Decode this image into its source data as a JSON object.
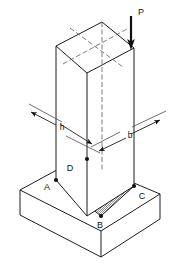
{
  "figure": {
    "type": "engineering-isometric-diagram",
    "background_color": "#ffffff",
    "line_color": "#1c1c1c",
    "hatch_color": "#9a9a9a"
  },
  "labels": {
    "load": "P",
    "depth": "h",
    "width": "b",
    "corner_a": "A",
    "corner_b": "B",
    "corner_c": "C",
    "corner_d": "D"
  },
  "annotations": [
    {
      "id": "load-label",
      "text": "P",
      "x": 141,
      "y": 13,
      "role": "applied-load"
    },
    {
      "id": "dim-h-label",
      "text": "h",
      "x": 62,
      "y": 128,
      "role": "dimension"
    },
    {
      "id": "dim-b-label",
      "text": "b",
      "x": 130,
      "y": 135,
      "role": "dimension"
    },
    {
      "id": "corner-d-label",
      "text": "D",
      "x": 69,
      "y": 170,
      "role": "vertex"
    },
    {
      "id": "corner-a-label",
      "text": "A",
      "x": 46,
      "y": 188,
      "role": "vertex"
    },
    {
      "id": "corner-c-label",
      "text": "C",
      "x": 135,
      "y": 198,
      "role": "vertex"
    },
    {
      "id": "corner-b-label",
      "text": "B",
      "x": 100,
      "y": 224,
      "role": "vertex"
    }
  ],
  "geometry": {
    "column": {
      "top_face": [
        [
          56,
          46
        ],
        [
          102,
          22
        ],
        [
          134,
          48
        ],
        [
          87,
          73
        ]
      ],
      "front_left_face": [
        [
          56,
          46
        ],
        [
          87,
          73
        ],
        [
          87,
          216
        ],
        [
          56,
          180
        ]
      ],
      "front_right_face": [
        [
          87,
          73
        ],
        [
          134,
          48
        ],
        [
          134,
          186
        ],
        [
          87,
          216
        ]
      ],
      "left_edge": [
        [
          56,
          46
        ],
        [
          56,
          180
        ]
      ],
      "mid_edge": [
        [
          87,
          73
        ],
        [
          87,
          216
        ]
      ],
      "right_edge": [
        [
          134,
          48
        ],
        [
          134,
          186
        ]
      ],
      "hidden_back_vertical": [
        [
          102,
          22
        ],
        [
          102,
          170
        ]
      ]
    },
    "base_slab": {
      "top_face": [
        [
          20,
          190
        ],
        [
          77,
          159
        ],
        [
          160,
          194
        ],
        [
          101,
          231
        ]
      ],
      "right_face": [
        [
          160,
          194
        ],
        [
          160,
          219
        ],
        [
          101,
          257
        ],
        [
          101,
          231
        ]
      ],
      "left_face": [
        [
          20,
          190
        ],
        [
          20,
          215
        ],
        [
          101,
          257
        ],
        [
          101,
          231
        ]
      ],
      "break_stubs": [
        [
          [
            20,
            190
          ],
          [
            20,
            215
          ]
        ],
        [
          [
            160,
            194
          ],
          [
            160,
            219
          ]
        ],
        [
          [
            101,
            231
          ],
          [
            101,
            257
          ]
        ]
      ]
    },
    "footprint": {
      "corners": {
        "A": [
          56,
          180
        ],
        "B": [
          101,
          216
        ],
        "C": [
          134,
          186
        ],
        "D": [
          87,
          159
        ]
      },
      "fill": "stipple-gray"
    },
    "dimension_h": {
      "from": [
        33,
        113
      ],
      "to": [
        92,
        144
      ],
      "label_at": [
        62,
        128
      ],
      "extension_top": [
        [
          33,
          106
        ],
        [
          60,
          122
        ]
      ],
      "extension_bottom": [
        [
          67,
          137
        ],
        [
          100,
          152
        ]
      ]
    },
    "dimension_b": {
      "from": [
        100,
        150
      ],
      "to": [
        158,
        121
      ],
      "label_at": [
        130,
        135
      ],
      "extension_left": [
        [
          92,
          146
        ],
        [
          118,
          133
        ]
      ],
      "extension_right": [
        [
          133,
          128
        ],
        [
          164,
          113
        ]
      ]
    },
    "load_arrow": {
      "shaft_from": [
        131,
        16
      ],
      "shaft_to": [
        131,
        44
      ],
      "tip": [
        131,
        50
      ],
      "direction": "down",
      "applied_at_vertex": [
        134,
        48
      ]
    },
    "centerlines": {
      "vertical": [
        [
          102,
          22
        ],
        [
          102,
          172
        ]
      ],
      "top_face_long": [
        [
          65,
          63
        ],
        [
          125,
          30
        ]
      ],
      "top_face_cross": [
        [
          71,
          29
        ],
        [
          122,
          66
        ]
      ]
    }
  }
}
